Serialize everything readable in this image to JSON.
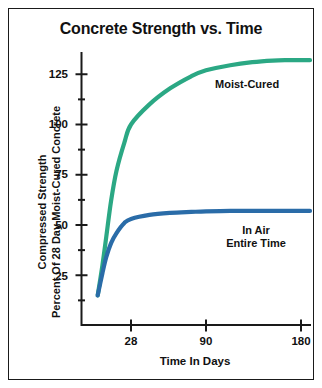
{
  "figure": {
    "title": "Concrete Strength vs. Time",
    "background": "#ffffff",
    "frame_color": "#1a1a1a",
    "text_color": "#111111"
  },
  "chart_data": {
    "type": "line",
    "title": "Concrete Strength vs. Time",
    "xlabel": "Time In Days",
    "ylabel": "Compressed Strength Percent Of 28 Day Moist-Cured Concrete",
    "ylabel_lines": [
      "Compressed Strength",
      "Percent Of 28 Day Moist-Cured Concrete"
    ],
    "xlim": [
      0,
      190
    ],
    "ylim": [
      0,
      137
    ],
    "x_scale": "nonlinear-compressed",
    "grid": false,
    "legend_position": "inline-annotations",
    "xticks": [
      28,
      90,
      180
    ],
    "xtick_labels": [
      "28",
      "90",
      "180"
    ],
    "yticks": [
      25,
      50,
      75,
      100,
      125
    ],
    "ytick_labels": [
      "25",
      "50",
      "75",
      "100",
      "125"
    ],
    "y_minor_ticks": [
      12.5,
      37.5,
      62.5,
      87.5,
      112.5,
      137.5
    ],
    "series": [
      {
        "name": "Moist-Cured",
        "color": "#2ba884",
        "label": "Moist-Cured",
        "x": [
          3,
          5,
          7,
          10,
          14,
          21,
          28,
          40,
          56,
          75,
          90,
          110,
          130,
          150,
          165,
          180,
          190
        ],
        "values": [
          15,
          30,
          44,
          62,
          77,
          91,
          100,
          110,
          118,
          124,
          127,
          129.5,
          131,
          131.8,
          132,
          132,
          132
        ]
      },
      {
        "name": "In Air Entire Time",
        "color": "#2a6ca8",
        "label": "In Air\nEntire Time",
        "label_lines": [
          "In Air",
          "Entire Time"
        ],
        "x": [
          3,
          5,
          7,
          10,
          14,
          21,
          28,
          40,
          56,
          75,
          90,
          110,
          130,
          150,
          165,
          180,
          190
        ],
        "values": [
          15,
          26,
          34,
          41,
          46,
          51,
          53,
          55,
          56,
          56.5,
          56.8,
          57,
          57,
          57,
          57,
          57,
          57
        ]
      }
    ],
    "annotations": [
      {
        "text": "Moist-Cured",
        "series": "Moist-Cured"
      },
      {
        "text": "In Air Entire Time",
        "series": "In Air Entire Time"
      }
    ]
  }
}
